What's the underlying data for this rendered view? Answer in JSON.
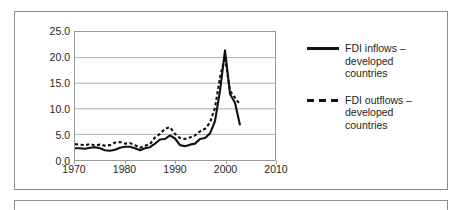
{
  "figure": {
    "lower_box_empty": true
  },
  "chart_data": {
    "type": "line",
    "title": "",
    "subtitle": "",
    "xlabel": "",
    "ylabel": "",
    "xlim": [
      1970,
      2010
    ],
    "ylim": [
      0.0,
      25.0
    ],
    "grid": true,
    "legend_position": "right",
    "x_ticks": [
      "1970",
      "1980",
      "1990",
      "2000",
      "2010"
    ],
    "x_tick_values": [
      1970,
      1980,
      1990,
      2000,
      2010
    ],
    "y_ticks": [
      "0.0",
      "5.0",
      "10.0",
      "15.0",
      "20.0",
      "25.0"
    ],
    "y_tick_values": [
      0.0,
      5.0,
      10.0,
      15.0,
      20.0,
      25.0
    ],
    "x": [
      1970,
      1971,
      1972,
      1973,
      1974,
      1975,
      1976,
      1977,
      1978,
      1979,
      1980,
      1981,
      1982,
      1983,
      1984,
      1985,
      1986,
      1987,
      1988,
      1989,
      1990,
      1991,
      1992,
      1993,
      1994,
      1995,
      1996,
      1997,
      1998,
      1999,
      2000,
      2001,
      2002,
      2003
    ],
    "series": [
      {
        "name": "FDI inflows – developed countries",
        "style": "solid",
        "color": "#111111",
        "values": [
          2.3,
          2.3,
          2.2,
          2.4,
          2.5,
          2.3,
          1.9,
          1.8,
          2.0,
          2.4,
          2.6,
          2.6,
          2.3,
          1.9,
          2.3,
          2.5,
          3.2,
          4.0,
          4.1,
          4.8,
          4.2,
          2.9,
          2.7,
          3.0,
          3.2,
          4.1,
          4.3,
          5.2,
          7.6,
          13.5,
          21.4,
          12.9,
          11.2,
          6.8
        ]
      },
      {
        "name": "FDI outflows – developed countries",
        "style": "dashed",
        "color": "#111111",
        "values": [
          3.1,
          3.0,
          2.9,
          3.1,
          2.8,
          3.0,
          2.8,
          2.9,
          3.4,
          3.5,
          3.2,
          3.3,
          2.9,
          2.4,
          2.8,
          3.1,
          4.4,
          5.1,
          6.1,
          6.4,
          5.1,
          4.3,
          4.1,
          4.4,
          4.8,
          5.6,
          6.1,
          7.3,
          10.2,
          16.1,
          20.1,
          13.5,
          12.2,
          10.8
        ]
      }
    ]
  },
  "legend": {
    "entries": [
      {
        "label": "FDI inflows –\ndeveloped\ncountries",
        "style": "solid"
      },
      {
        "label": "FDI outflows –\ndeveloped\ncountries",
        "style": "dashed"
      }
    ]
  }
}
